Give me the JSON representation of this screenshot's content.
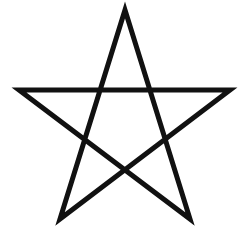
{
  "image": {
    "description": "Pentagram (five-pointed star) outline",
    "background": "#ffffff",
    "stroke_color": "#111111",
    "stroke_width": 5,
    "vertices": [
      {
        "name": "top",
        "x": 125,
        "y": 10
      },
      {
        "name": "bottom-right",
        "x": 190,
        "y": 219
      },
      {
        "name": "left",
        "x": 19,
        "y": 90
      },
      {
        "name": "right",
        "x": 230,
        "y": 90
      },
      {
        "name": "bottom-left",
        "x": 60,
        "y": 219
      }
    ],
    "points_attr": "125,10 190,219 19,90 230,90 60,219"
  }
}
